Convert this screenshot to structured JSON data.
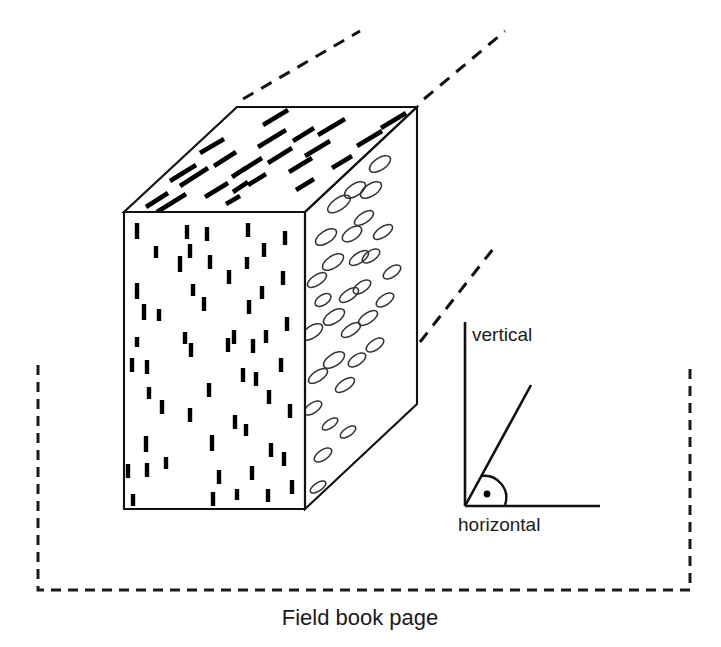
{
  "figure": {
    "caption": "Field book page",
    "colors": {
      "ink": "#111111",
      "pore_outline": "#333333",
      "background": "#ffffff"
    }
  },
  "block": {
    "name": "rock-block-3d",
    "faces": [
      {
        "id": "top-face",
        "fill_pattern": "diagonal-dashes",
        "description": "bedding-plane trace lines"
      },
      {
        "id": "front-face",
        "fill_pattern": "vertical-dashes",
        "description": "fracture traces seen edge on"
      },
      {
        "id": "right-face",
        "fill_pattern": "ellipse-outlines",
        "description": "pore / clast outlines"
      }
    ],
    "geometry": {
      "front_top_left": [
        124,
        212
      ],
      "front_top_right": [
        305,
        212
      ],
      "front_bottom_left": [
        124,
        509
      ],
      "front_bottom_right": [
        305,
        509
      ],
      "back_top_left": [
        237,
        107
      ],
      "back_top_right": [
        417,
        107
      ],
      "back_bottom_right": [
        417,
        404
      ]
    }
  },
  "leaders": {
    "name": "dashed-leader-lines",
    "lines": [
      {
        "id": "leader-top-left",
        "from": [
          243,
          99
        ],
        "to": [
          360,
          31
        ]
      },
      {
        "id": "leader-top-right",
        "from": [
          424,
          99
        ],
        "to": [
          505,
          31
        ]
      },
      {
        "id": "leader-to-angle",
        "from": [
          420,
          342
        ],
        "to": [
          497,
          244
        ]
      }
    ]
  },
  "angle_diagram": {
    "name": "dip-angle-inset",
    "vertical_label": "vertical",
    "horizontal_label": "horizontal",
    "origin": [
      465,
      506
    ],
    "vertical_end": [
      465,
      322
    ],
    "horizontal_end": [
      600,
      506
    ],
    "inclined_end": [
      531,
      385
    ],
    "angle_marker": "dot-in-arc",
    "dot_center": [
      487,
      494
    ]
  },
  "page": {
    "name": "field-book-page-border",
    "style": "dashed",
    "left": 38,
    "right": 690,
    "top_left_y": 365,
    "top_right_y": 362,
    "bottom": 590
  },
  "patterns": {
    "top_face_dashes": [
      [
        146,
        207,
        168,
        193
      ],
      [
        157,
        212,
        186,
        194
      ],
      [
        180,
        186,
        208,
        168
      ],
      [
        214,
        166,
        236,
        152
      ],
      [
        232,
        177,
        246,
        168
      ],
      [
        243,
        170,
        262,
        158
      ],
      [
        205,
        197,
        228,
        183
      ],
      [
        233,
        192,
        248,
        182
      ],
      [
        258,
        147,
        286,
        130
      ],
      [
        268,
        163,
        292,
        148
      ],
      [
        248,
        185,
        266,
        174
      ],
      [
        289,
        172,
        312,
        158
      ],
      [
        296,
        190,
        314,
        179
      ],
      [
        305,
        156,
        330,
        141
      ],
      [
        318,
        135,
        345,
        119
      ],
      [
        332,
        168,
        352,
        156
      ],
      [
        341,
        186,
        358,
        176
      ],
      [
        357,
        146,
        382,
        131
      ],
      [
        366,
        165,
        386,
        153
      ],
      [
        378,
        186,
        394,
        176
      ],
      [
        381,
        128,
        406,
        113
      ],
      [
        392,
        150,
        410,
        139
      ],
      [
        170,
        181,
        196,
        165
      ],
      [
        200,
        153,
        224,
        139
      ],
      [
        263,
        125,
        288,
        110
      ],
      [
        226,
        204,
        240,
        196
      ],
      [
        293,
        141,
        314,
        128
      ]
    ],
    "front_face_dashes": [
      [
        137,
        223,
        137,
        239
      ],
      [
        137,
        283,
        137,
        299
      ],
      [
        137,
        337,
        137,
        347
      ],
      [
        144,
        304,
        144,
        320
      ],
      [
        147,
        360,
        147,
        374
      ],
      [
        149,
        387,
        149,
        399
      ],
      [
        146,
        436,
        146,
        452
      ],
      [
        147,
        463,
        147,
        477
      ],
      [
        132,
        358,
        132,
        372
      ],
      [
        128,
        464,
        128,
        478
      ],
      [
        133,
        494,
        133,
        506
      ],
      [
        156,
        246,
        156,
        258
      ],
      [
        159,
        309,
        159,
        321
      ],
      [
        162,
        400,
        162,
        414
      ],
      [
        166,
        457,
        166,
        469
      ],
      [
        180,
        256,
        180,
        272
      ],
      [
        187,
        225,
        187,
        239
      ],
      [
        190,
        244,
        190,
        258
      ],
      [
        185,
        332,
        185,
        344
      ],
      [
        191,
        343,
        191,
        357
      ],
      [
        190,
        408,
        190,
        422
      ],
      [
        193,
        284,
        193,
        296
      ],
      [
        207,
        227,
        207,
        241
      ],
      [
        210,
        255,
        210,
        269
      ],
      [
        204,
        297,
        204,
        311
      ],
      [
        209,
        383,
        209,
        397
      ],
      [
        212,
        435,
        212,
        451
      ],
      [
        213,
        492,
        213,
        506
      ],
      [
        228,
        338,
        228,
        352
      ],
      [
        234,
        330,
        234,
        344
      ],
      [
        235,
        415,
        235,
        429
      ],
      [
        229,
        270,
        229,
        284
      ],
      [
        237,
        489,
        237,
        500
      ],
      [
        248,
        223,
        248,
        237
      ],
      [
        247,
        257,
        247,
        269
      ],
      [
        249,
        300,
        249,
        314
      ],
      [
        243,
        368,
        243,
        382
      ],
      [
        246,
        424,
        246,
        436
      ],
      [
        252,
        466,
        252,
        480
      ],
      [
        264,
        243,
        264,
        257
      ],
      [
        262,
        286,
        262,
        299
      ],
      [
        266,
        330,
        266,
        343
      ],
      [
        269,
        390,
        269,
        404
      ],
      [
        271,
        443,
        271,
        457
      ],
      [
        268,
        489,
        268,
        502
      ],
      [
        285,
        231,
        285,
        245
      ],
      [
        283,
        271,
        283,
        285
      ],
      [
        287,
        317,
        287,
        331
      ],
      [
        281,
        358,
        281,
        372
      ],
      [
        290,
        404,
        290,
        418
      ],
      [
        284,
        452,
        284,
        466
      ],
      [
        292,
        480,
        292,
        494
      ],
      [
        253,
        339,
        253,
        353
      ],
      [
        256,
        372,
        256,
        386
      ],
      [
        219,
        470,
        219,
        484
      ]
    ],
    "right_face_ellipses": [
      [
        330,
        176,
        14,
        7,
        -34
      ],
      [
        339,
        204,
        13,
        6,
        -34
      ],
      [
        326,
        237,
        12,
        6,
        -34
      ],
      [
        345,
        162,
        13,
        6,
        -34
      ],
      [
        355,
        190,
        12,
        6,
        -34
      ],
      [
        317,
        280,
        11,
        5,
        -34
      ],
      [
        333,
        262,
        12,
        6,
        -34
      ],
      [
        323,
        300,
        9,
        5,
        -34
      ],
      [
        312,
        332,
        12,
        6,
        -34
      ],
      [
        334,
        317,
        12,
        6,
        -34
      ],
      [
        352,
        234,
        11,
        6,
        -34
      ],
      [
        359,
        258,
        11,
        5,
        -34
      ],
      [
        364,
        218,
        11,
        5,
        -34
      ],
      [
        371,
        190,
        12,
        6,
        -34
      ],
      [
        380,
        164,
        12,
        6,
        -34
      ],
      [
        349,
        295,
        11,
        5,
        -34
      ],
      [
        362,
        287,
        10,
        5,
        -34
      ],
      [
        371,
        256,
        10,
        5,
        -34
      ],
      [
        383,
        232,
        11,
        5,
        -34
      ],
      [
        318,
        376,
        11,
        5,
        -34
      ],
      [
        334,
        360,
        12,
        6,
        -34
      ],
      [
        345,
        385,
        11,
        5,
        -34
      ],
      [
        313,
        408,
        10,
        5,
        -34
      ],
      [
        330,
        424,
        9,
        4,
        -34
      ],
      [
        351,
        330,
        11,
        5,
        -34
      ],
      [
        368,
        318,
        11,
        5,
        -34
      ],
      [
        385,
        300,
        10,
        5,
        -34
      ],
      [
        357,
        360,
        10,
        5,
        -34
      ],
      [
        375,
        345,
        10,
        5,
        -34
      ],
      [
        323,
        455,
        10,
        5,
        -34
      ],
      [
        318,
        487,
        9,
        4,
        -34
      ],
      [
        392,
        272,
        10,
        5,
        -34
      ],
      [
        348,
        432,
        9,
        4,
        -34
      ]
    ]
  }
}
